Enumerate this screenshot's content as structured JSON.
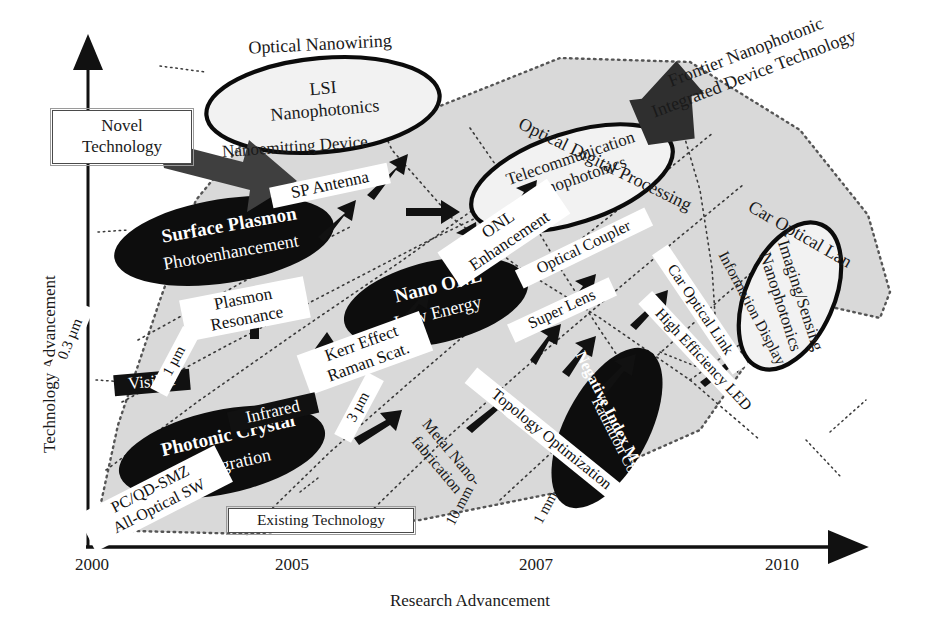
{
  "figure": {
    "kind": "technology-roadmap-scatter",
    "x_axis": {
      "title": "Research Advancement",
      "ticks": [
        "2000",
        "2005",
        "2007",
        "2010"
      ]
    },
    "y_axis": {
      "title": "Technology Advancement"
    },
    "callout_boxes": {
      "novel": "Novel\nTechnology",
      "existing": "Existing Technology"
    },
    "frontier_caption": "Frontier Nanophotonic\nIntegrated Device Technology"
  },
  "ellipses_open": [
    {
      "id": "lsi",
      "label": "LSI\nNanophotonics"
    },
    {
      "id": "telecom",
      "label": "Telecommunication\nNanophotonics"
    },
    {
      "id": "imaging",
      "label": "Imaging/Sensing\nNanophotonics"
    }
  ],
  "ellipses_filled": [
    {
      "id": "surface-plasmon",
      "line1": "Surface Plasmon",
      "line2": "Photoenhancement"
    },
    {
      "id": "nano-onl",
      "line1": "Nano ONL",
      "line2": "Low Energy"
    },
    {
      "id": "photonic-crystal",
      "line1": "Photonic Crystal",
      "line2": "Integration"
    },
    {
      "id": "negative-index",
      "line1": "Negative Index Material",
      "line2": "Radiation Control"
    }
  ],
  "group_labels": [
    {
      "id": "optical-nanowiring",
      "text": "Optical Nanowiring"
    },
    {
      "id": "optical-digital-processing",
      "text": "Optical Digital Processing"
    },
    {
      "id": "car-optical-lan",
      "text": "Car Optical Lan"
    }
  ],
  "node_chips": [
    {
      "id": "nanoemitting-device",
      "text": "Nanoemitting Device"
    },
    {
      "id": "sp-antenna",
      "text": "SP Antenna"
    },
    {
      "id": "onl-enhancement",
      "text": "ONL\nEnhancement"
    },
    {
      "id": "optical-coupler",
      "text": "Optical Coupler"
    },
    {
      "id": "plasmon-resonance",
      "text": "Plasmon\nResonance"
    },
    {
      "id": "kerr-effect",
      "text": "Kerr Effect\nRaman Scat."
    },
    {
      "id": "super-lens",
      "text": "Super Lens"
    },
    {
      "id": "car-optical-link",
      "text": "Car Optical Link"
    },
    {
      "id": "information-display",
      "text": "Information Display"
    },
    {
      "id": "high-efficiency-led",
      "text": "High Efficiency LED"
    },
    {
      "id": "topology-optimization",
      "text": "Topology Optimization"
    },
    {
      "id": "metal-nanofabrication",
      "text": "Metal Nano-\nfabrication"
    },
    {
      "id": "pc-qd-smz",
      "text": "PC/QD-SMZ\nAll-Optical SW"
    }
  ],
  "band_chips_dark": [
    {
      "id": "visible",
      "text": "Visible"
    },
    {
      "id": "infrared",
      "text": "Infrared"
    }
  ],
  "scale_labels": [
    {
      "id": "scale-03um",
      "text": "0.3 µm"
    },
    {
      "id": "scale-1um",
      "text": "1 µm"
    },
    {
      "id": "scale-3um",
      "text": "3 µm"
    },
    {
      "id": "scale-10mm",
      "text": "10 mm"
    },
    {
      "id": "scale-1mm",
      "text": "1 mm"
    }
  ],
  "colors": {
    "ink": "#111111",
    "paper": "#ffffff",
    "region_fill": "#d9d9d9",
    "filled_ellipse": "#0d0d0d",
    "big_arrow": "#3a3a3a"
  }
}
